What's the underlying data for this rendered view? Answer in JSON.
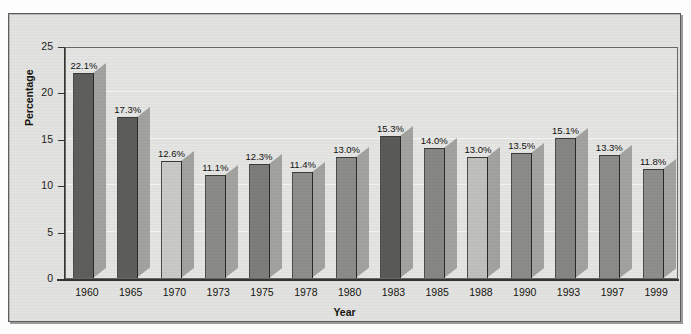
{
  "chart_data": {
    "type": "bar",
    "title": "",
    "xlabel": "Year",
    "ylabel": "Percentage",
    "categories": [
      "1960",
      "1965",
      "1970",
      "1973",
      "1975",
      "1978",
      "1980",
      "1983",
      "1985",
      "1988",
      "1990",
      "1993",
      "1997",
      "1999"
    ],
    "values": [
      22.1,
      17.3,
      12.6,
      11.1,
      12.3,
      11.4,
      13.0,
      15.3,
      14.0,
      13.0,
      13.5,
      15.1,
      13.3,
      11.8
    ],
    "value_labels": [
      "22.1%",
      "17.3%",
      "12.6%",
      "11.1%",
      "12.3%",
      "11.4%",
      "13.0%",
      "15.3%",
      "14.0%",
      "13.0%",
      "13.5%",
      "15.1%",
      "13.3%",
      "11.8%"
    ],
    "bar_colors": [
      "#5e5e5c",
      "#5d5d5b",
      "#c9c9c6",
      "#8a8a87",
      "#7d7d7a",
      "#8e8e8b",
      "#8c8c89",
      "#5a5a58",
      "#868683",
      "#bfbfbc",
      "#8b8b88",
      "#858582",
      "#8b8b88",
      "#8e8e8b"
    ],
    "ylim": [
      0,
      25
    ],
    "yticks": [
      0,
      5,
      10,
      15,
      20,
      25
    ],
    "ytick_labels": [
      "0",
      "5",
      "10",
      "15",
      "20",
      "25"
    ],
    "grid": true,
    "legend": "none",
    "style": "3d-drop-shadow-grayscale"
  },
  "axes": {
    "y_title": "Percentage",
    "x_title": "Year"
  },
  "colors": {
    "page_background": "#fdfdfd",
    "frame_background": "#e2e2e0",
    "plot_background": "#e4e4e2",
    "axis_line": "#35352f",
    "gridline": "#f4f4f2",
    "text": "#15150f",
    "shadow": "#9a9a97"
  }
}
